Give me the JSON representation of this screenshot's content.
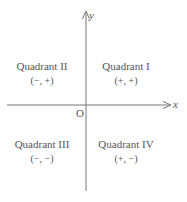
{
  "diagram": {
    "axes": {
      "x_label": "x",
      "y_label": "y",
      "origin_label": "O",
      "color": "#777777"
    },
    "quadrants": [
      {
        "id": "I",
        "name": "Quadrant I",
        "signs": "(+, +)"
      },
      {
        "id": "II",
        "name": "Quadrant II",
        "signs": "(−, +)"
      },
      {
        "id": "III",
        "name": "Quadrant III",
        "signs": "(−, −)"
      },
      {
        "id": "IV",
        "name": "Quadrant IV",
        "signs": "(+, −)"
      }
    ],
    "text_color": "#555555"
  }
}
